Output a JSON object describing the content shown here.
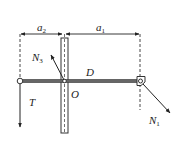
{
  "diagram": {
    "labels": {
      "a2": {
        "main": "a",
        "sub": "2"
      },
      "a1": {
        "main": "a",
        "sub": "1"
      },
      "N3": {
        "main": "N",
        "sub": "3"
      },
      "N1": {
        "main": "N",
        "sub": "1"
      },
      "D": "D",
      "O": "O",
      "T": "T"
    },
    "colors": {
      "stroke": "#333333",
      "beam": "#555555",
      "background": "#ffffff"
    }
  }
}
